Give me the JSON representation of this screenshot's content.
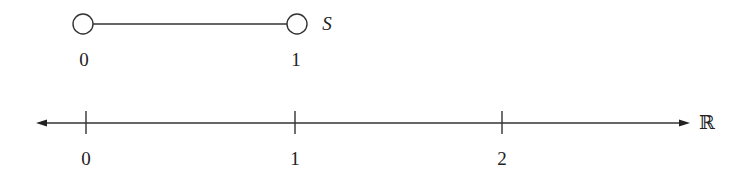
{
  "top_segment": {
    "name": "S",
    "endpoints": [
      {
        "value": "0",
        "type": "open"
      },
      {
        "value": "1",
        "type": "open"
      }
    ]
  },
  "real_line": {
    "name": "ℝ",
    "ticks": [
      "0",
      "1",
      "2"
    ],
    "arrows": "both"
  }
}
